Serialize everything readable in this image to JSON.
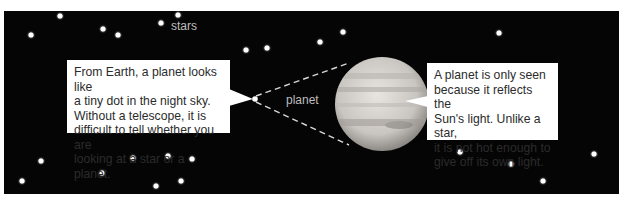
{
  "diagram": {
    "labels": {
      "stars": "stars",
      "planet": "planet"
    },
    "callouts": {
      "left": "From Earth, a planet looks like a tiny dot in the night sky. Without a telescope, it is difficult to tell whether you are looking at a star or a planet.",
      "left_lines": [
        "From Earth, a planet looks like",
        "a tiny dot in the night sky.",
        "Without a telescope, it is",
        "difficult to tell whether you are",
        "looking at a star or a planet."
      ],
      "right": "A planet is only seen because it reflects the Sun's light. Unlike a star, it is not hot enough to give off its own light.",
      "right_lines": [
        "A planet is only seen",
        "because it reflects the",
        "Sun's light. Unlike a star,",
        "it is not hot enough to",
        "give off its own light."
      ]
    },
    "elements": {
      "background": "night-sky",
      "planet_image": "jupiter-like-planet",
      "distant_planet_dot": "planet-dot",
      "view_lines": "dashed-sight-lines"
    },
    "colors": {
      "sky": "#050505",
      "star": "#ffffff",
      "callout_bg": "#ffffff",
      "callout_text": "#2b2b2b",
      "label_text": "#bdbdbd",
      "planet_light": "#d9d6d2",
      "planet_band": "#a9a5a1"
    }
  }
}
